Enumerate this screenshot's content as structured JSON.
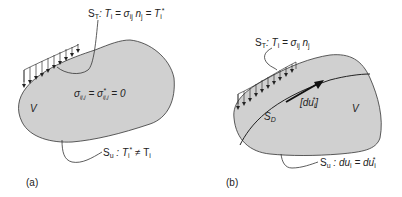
{
  "panel_a": {
    "caption": "(a)",
    "region_label": "V",
    "traction_boundary": {
      "S": "S",
      "sub": "T",
      "eq": ": T",
      "i1": "i",
      "mid": " = σ",
      "ij": "ij",
      "n": " n",
      "j": "j",
      "eq2": " = T",
      "i2": "i",
      "star": "*"
    },
    "interior_eq": {
      "s1": "σ",
      "sub1": "ij,j",
      "eq": " = σ",
      "star": "*",
      "sub2": "ij,j",
      "rest": " = 0"
    },
    "displacement_boundary": {
      "S": "S",
      "sub": "u",
      "text": " : T",
      "i1": "i",
      "star": "*",
      "neq": " ≠ T",
      "i2": "i"
    }
  },
  "panel_b": {
    "caption": "(b)",
    "region_label": "V",
    "discontinuity_label": {
      "S": "S",
      "sub": "D"
    },
    "jump_label": {
      "text": "[du",
      "i": "i",
      "star": "*",
      "close": "]"
    },
    "traction_boundary": {
      "S": "S",
      "sub": "T",
      "eq": ": T",
      "i1": "i",
      "mid": " = σ",
      "ij": "ij",
      "n": " n",
      "j": "j"
    },
    "displacement_boundary": {
      "S": "S",
      "sub": "u",
      "text": " : du",
      "i1": "i",
      "eq": " = du",
      "i2": "i",
      "star": "*"
    }
  },
  "colors": {
    "body_fill": "#d0d0d0",
    "stroke": "#333333",
    "text": "#222222"
  }
}
